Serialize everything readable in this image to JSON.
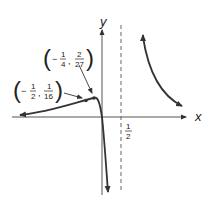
{
  "graph": {
    "x_axis_label": "x",
    "y_axis_label": "y",
    "asymptote_label": {
      "num": "1",
      "den": "2"
    },
    "points": [
      {
        "name": "local-max",
        "x_sign": "−",
        "x_num": "1",
        "x_den": "4",
        "y_num": "2",
        "y_den": "27"
      },
      {
        "name": "inflection",
        "x_sign": "−",
        "x_num": "1",
        "x_den": "2",
        "y_num": "1",
        "y_den": "16"
      }
    ],
    "colors": {
      "curve": "#333333",
      "axis": "#555555",
      "text": "#222222"
    }
  }
}
